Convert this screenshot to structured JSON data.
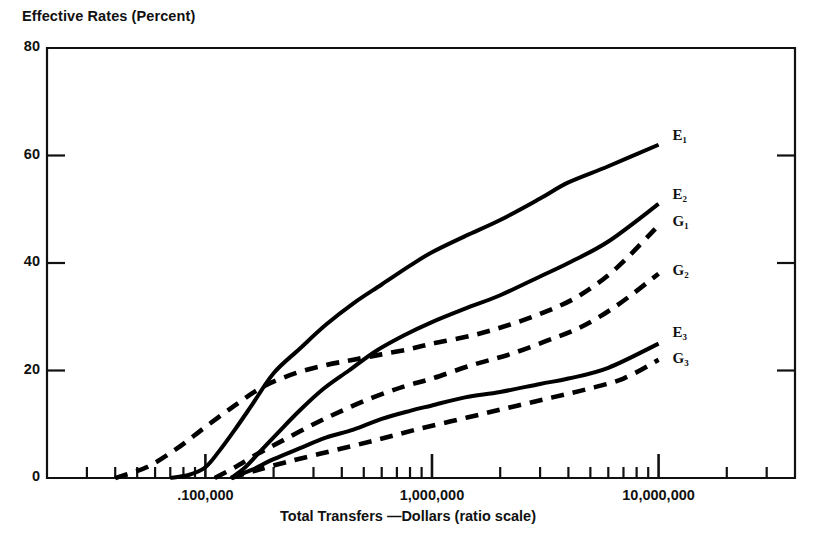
{
  "chart_data": {
    "type": "line",
    "title": "Effective Rates (Percent)",
    "ylabel": "Effective Rates (Percent)",
    "xlabel": "Total Transfers —Dollars (ratio scale)",
    "xscale": "log",
    "xlim": [
      20000,
      40000000
    ],
    "ylim": [
      0,
      80
    ],
    "grid": false,
    "legend_position": "right-inline",
    "ytick_labels": [
      "0",
      "20",
      "40",
      "60",
      "80"
    ],
    "ytick_values": [
      0,
      20,
      40,
      60,
      80
    ],
    "xtick_labels": [
      ".100,000",
      "1,000,000",
      "10,000,000"
    ],
    "xtick_values": [
      100000,
      1000000,
      10000000
    ],
    "xminor_ticks": [
      30000,
      40000,
      50000,
      60000,
      70000,
      80000,
      90000,
      200000,
      300000,
      400000,
      500000,
      600000,
      700000,
      800000,
      900000,
      2000000,
      3000000,
      4000000,
      5000000,
      6000000,
      7000000,
      8000000,
      9000000,
      20000000,
      30000000
    ],
    "series": [
      {
        "name": "E1",
        "label": "E₁",
        "style": "solid",
        "color": "#000000",
        "points": [
          [
            70000,
            0
          ],
          [
            85000,
            0.6
          ],
          [
            100000,
            2.0
          ],
          [
            115000,
            5.0
          ],
          [
            135000,
            9.0
          ],
          [
            160000,
            13.5
          ],
          [
            200000,
            19.5
          ],
          [
            260000,
            24.0
          ],
          [
            340000,
            28.5
          ],
          [
            450000,
            32.5
          ],
          [
            600000,
            36.0
          ],
          [
            800000,
            39.5
          ],
          [
            1000000,
            42.0
          ],
          [
            1400000,
            45.0
          ],
          [
            2000000,
            48.0
          ],
          [
            3000000,
            52.0
          ],
          [
            4000000,
            55.0
          ],
          [
            6000000,
            58.0
          ],
          [
            10000000,
            62.0
          ]
        ]
      },
      {
        "name": "E2",
        "label": "E₂",
        "style": "solid",
        "color": "#000000",
        "points": [
          [
            130000,
            0
          ],
          [
            150000,
            2.0
          ],
          [
            175000,
            5.0
          ],
          [
            210000,
            8.5
          ],
          [
            260000,
            12.5
          ],
          [
            330000,
            16.5
          ],
          [
            430000,
            20.0
          ],
          [
            560000,
            23.5
          ],
          [
            750000,
            26.5
          ],
          [
            1000000,
            29.0
          ],
          [
            1400000,
            31.5
          ],
          [
            2000000,
            34.0
          ],
          [
            3000000,
            37.5
          ],
          [
            4000000,
            40.0
          ],
          [
            6000000,
            44.0
          ],
          [
            10000000,
            51.0
          ]
        ]
      },
      {
        "name": "G1",
        "label": "G₁",
        "style": "dashed",
        "color": "#000000",
        "points": [
          [
            40000,
            0
          ],
          [
            55000,
            2.0
          ],
          [
            75000,
            5.5
          ],
          [
            100000,
            9.5
          ],
          [
            135000,
            13.5
          ],
          [
            180000,
            17.0
          ],
          [
            250000,
            19.5
          ],
          [
            340000,
            21.0
          ],
          [
            450000,
            22.0
          ],
          [
            600000,
            23.0
          ],
          [
            800000,
            24.0
          ],
          [
            1000000,
            25.0
          ],
          [
            1500000,
            26.5
          ],
          [
            2200000,
            28.5
          ],
          [
            3200000,
            31.0
          ],
          [
            4500000,
            34.0
          ],
          [
            6500000,
            39.0
          ],
          [
            10000000,
            47.0
          ]
        ]
      },
      {
        "name": "G2",
        "label": "G₂",
        "style": "dashed",
        "color": "#000000",
        "points": [
          [
            110000,
            0
          ],
          [
            135000,
            2.0
          ],
          [
            170000,
            4.5
          ],
          [
            220000,
            7.0
          ],
          [
            300000,
            10.0
          ],
          [
            400000,
            12.5
          ],
          [
            550000,
            15.0
          ],
          [
            750000,
            17.0
          ],
          [
            1000000,
            18.5
          ],
          [
            1500000,
            21.0
          ],
          [
            2200000,
            23.0
          ],
          [
            3200000,
            25.5
          ],
          [
            4500000,
            28.0
          ],
          [
            6500000,
            32.0
          ],
          [
            10000000,
            38.0
          ]
        ]
      },
      {
        "name": "E3",
        "label": "E₃",
        "style": "solid",
        "color": "#000000",
        "points": [
          [
            130000,
            0
          ],
          [
            160000,
            1.5
          ],
          [
            200000,
            3.5
          ],
          [
            260000,
            5.5
          ],
          [
            340000,
            7.5
          ],
          [
            450000,
            9.0
          ],
          [
            600000,
            11.0
          ],
          [
            800000,
            12.5
          ],
          [
            1000000,
            13.5
          ],
          [
            1400000,
            15.0
          ],
          [
            2000000,
            16.0
          ],
          [
            3000000,
            17.5
          ],
          [
            4000000,
            18.5
          ],
          [
            6000000,
            20.5
          ],
          [
            10000000,
            25.0
          ]
        ]
      },
      {
        "name": "G3",
        "label": "G₃",
        "style": "dashed",
        "color": "#000000",
        "points": [
          [
            130000,
            0
          ],
          [
            170000,
            1.5
          ],
          [
            230000,
            3.0
          ],
          [
            320000,
            4.5
          ],
          [
            450000,
            6.0
          ],
          [
            620000,
            7.5
          ],
          [
            850000,
            9.0
          ],
          [
            1200000,
            10.5
          ],
          [
            1700000,
            12.0
          ],
          [
            2400000,
            13.5
          ],
          [
            3400000,
            15.0
          ],
          [
            4800000,
            16.5
          ],
          [
            7000000,
            18.5
          ],
          [
            10000000,
            22.0
          ]
        ]
      }
    ]
  }
}
